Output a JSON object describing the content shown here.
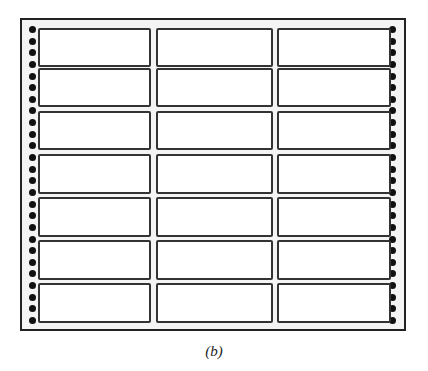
{
  "figure": {
    "caption": "(b)",
    "grid": {
      "columns": 3,
      "rows": 7
    },
    "holes_per_side": 26,
    "colors": {
      "frame": "#222222",
      "sheet": "#f4f4f4",
      "label_fill": "#ffffff",
      "label_border": "#333333",
      "hole": "#111111"
    }
  }
}
